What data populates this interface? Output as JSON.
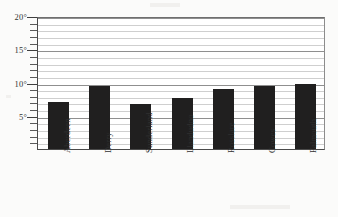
{
  "chart_data": {
    "type": "bar",
    "title": "",
    "xlabel": "",
    "ylabel": "",
    "categories": [
      "Aberdeen",
      "Derry",
      "Sunderland",
      "Llandudno",
      "Rosslare",
      "Cowes",
      "Falmouth"
    ],
    "values": [
      7.1,
      9.5,
      6.8,
      7.7,
      9.0,
      9.5,
      9.8
    ],
    "ylim": [
      0,
      20
    ],
    "y_ticks_major": [
      5,
      10,
      15,
      20
    ],
    "y_tick_labels": [
      "5°",
      "10°",
      "15°",
      "20°"
    ],
    "y_minor_step": 1,
    "grid": true,
    "legend": "none",
    "bar_color": "#201f1f",
    "unit": "°"
  },
  "axes": {
    "y_labels": [
      {
        "value": 20,
        "text": "20°"
      },
      {
        "value": 15,
        "text": "15°"
      },
      {
        "value": 10,
        "text": "10°"
      },
      {
        "value": 5,
        "text": "5°"
      }
    ],
    "x_labels": [
      {
        "text": "Aberdeen"
      },
      {
        "text": "Derry"
      },
      {
        "text": "Sunderland"
      },
      {
        "text": "Llandudno"
      },
      {
        "text": "Rosslare"
      },
      {
        "text": "Cowes"
      },
      {
        "text": "Falmouth"
      }
    ]
  }
}
